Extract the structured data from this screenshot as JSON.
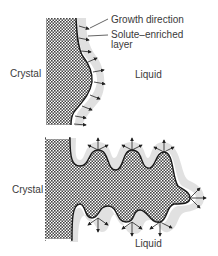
{
  "top_panel": {
    "crystal_label": "Crystal",
    "liquid_label": "Liquid",
    "annotations": {
      "growth_direction": "Growth direction",
      "solute_line1": "Solute–enriched",
      "solute_line2": "layer"
    }
  },
  "bottom_panel": {
    "crystal_label": "Crystal",
    "liquid_label": "Liquid"
  },
  "colors": {
    "crystal_fill": "#555555",
    "outline": "#1a1a1a",
    "solute_layer": "#d9d9d9",
    "arrow": "#222222"
  }
}
